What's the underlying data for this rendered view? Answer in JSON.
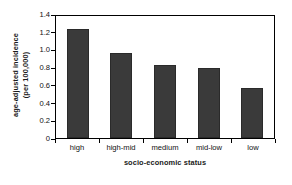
{
  "chart_data": {
    "type": "bar",
    "title": "",
    "subtitle": "",
    "categories": [
      "high",
      "high-mid",
      "medium",
      "mid-low",
      "low"
    ],
    "values": [
      1.23,
      0.96,
      0.82,
      0.79,
      0.57
    ],
    "series": [
      {
        "name": "age-adjusted incidence (per 100,000)",
        "values": [
          1.23,
          0.96,
          0.82,
          0.79,
          0.57
        ]
      }
    ],
    "xlabel": "socio-economic status",
    "ylabel_line1": "age-adjusted incidence",
    "ylabel_line2": "(per 100,000)",
    "ylim": [
      0,
      1.4
    ],
    "yticks": [
      "0",
      "0.2",
      "0.4",
      "0.6",
      "0.8",
      "1.0",
      "1.2",
      "1.4"
    ],
    "ytick_values": [
      0,
      0.2,
      0.4,
      0.6,
      0.8,
      1.0,
      1.2,
      1.4
    ],
    "grid": false,
    "legend": false,
    "legend_position": "none",
    "bar_color": "#3a3a3a",
    "frame_color": "#000000",
    "background_color": "#ffffff"
  }
}
